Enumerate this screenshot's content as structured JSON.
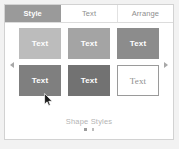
{
  "panel": {
    "name": "Format panel",
    "tabs": [
      {
        "label": "Style",
        "selected": true
      },
      {
        "label": "Text",
        "selected": false
      },
      {
        "label": "Arrange",
        "selected": false
      }
    ],
    "gallery": {
      "title": "Shape Styles",
      "prev_icon": "chevron-left-icon",
      "next_icon": "chevron-right-icon",
      "swatches": [
        {
          "label": "Text",
          "fill": "#bcbcbc",
          "text_color": "#ffffff",
          "outline": false
        },
        {
          "label": "Text",
          "fill": "#a4a4a4",
          "text_color": "#ffffff",
          "outline": false
        },
        {
          "label": "Text",
          "fill": "#8c8c8c",
          "text_color": "#ffffff",
          "outline": false
        },
        {
          "label": "Text",
          "fill": "#7f7f7f",
          "text_color": "#ffffff",
          "outline": false
        },
        {
          "label": "Text",
          "fill": "#727272",
          "text_color": "#ffffff",
          "outline": false
        },
        {
          "label": "Text",
          "fill": "#ffffff",
          "text_color": "#8e8e8e",
          "outline": true
        }
      ],
      "page_dots": 2,
      "active_dot": 0
    }
  },
  "cursor": {
    "icon": "arrow-pointer-icon",
    "x": 44,
    "y": 93
  },
  "colors": {
    "selected_tab_bg": "#9a9a9a",
    "panel_bg": "#ffffff",
    "page_bg": "#f2f2f2",
    "muted_text": "#8e8e8e"
  }
}
